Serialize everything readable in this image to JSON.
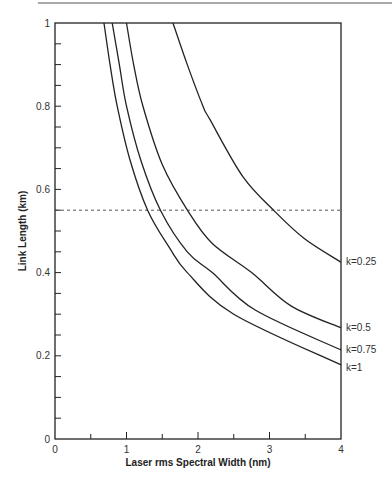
{
  "chart_data": {
    "type": "line",
    "title": "",
    "xlabel": "Laser rms Spectral Width (nm)",
    "ylabel": "Link Length (km)",
    "xlim": [
      0,
      4
    ],
    "ylim": [
      0,
      1
    ],
    "x_ticks": [
      "0",
      "1",
      "2",
      "3",
      "4"
    ],
    "y_ticks": [
      "0",
      "0.2",
      "0.4",
      "0.6",
      "0.8",
      "1"
    ],
    "grid": false,
    "legend_position": "inline labels at right end of curves",
    "series": [
      {
        "name": "k=0.25",
        "points": [
          [
            1.65,
            1.0
          ],
          [
            1.85,
            0.9
          ],
          [
            2.07,
            0.8
          ],
          [
            2.17,
            0.767
          ],
          [
            2.63,
            0.63
          ],
          [
            3.08,
            0.546
          ],
          [
            3.5,
            0.48
          ],
          [
            4.0,
            0.425
          ]
        ]
      },
      {
        "name": "k=0.5",
        "points": [
          [
            1.0,
            1.0
          ],
          [
            1.1,
            0.9
          ],
          [
            1.23,
            0.8
          ],
          [
            1.5,
            0.66
          ],
          [
            1.86,
            0.548
          ],
          [
            2.2,
            0.47
          ],
          [
            2.75,
            0.4
          ],
          [
            3.3,
            0.32
          ],
          [
            4.0,
            0.267
          ]
        ]
      },
      {
        "name": "k=0.75",
        "points": [
          [
            0.8,
            1.0
          ],
          [
            0.9,
            0.9
          ],
          [
            1.0,
            0.8
          ],
          [
            1.2,
            0.67
          ],
          [
            1.48,
            0.548
          ],
          [
            1.85,
            0.45
          ],
          [
            2.2,
            0.4
          ],
          [
            2.8,
            0.31
          ],
          [
            4.0,
            0.214
          ]
        ]
      },
      {
        "name": "k=1",
        "points": [
          [
            0.685,
            1.0
          ],
          [
            0.77,
            0.9
          ],
          [
            0.87,
            0.8
          ],
          [
            1.05,
            0.67
          ],
          [
            1.3,
            0.548
          ],
          [
            1.6,
            0.46
          ],
          [
            1.85,
            0.4
          ],
          [
            2.5,
            0.3
          ],
          [
            4.0,
            0.178
          ]
        ]
      }
    ],
    "annotations": [
      {
        "type": "horizontal-dashed-line",
        "y": 0.55
      }
    ]
  }
}
